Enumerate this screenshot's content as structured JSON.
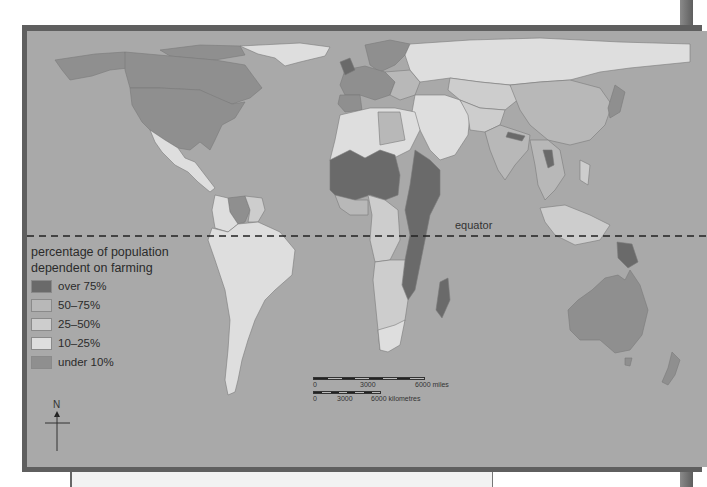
{
  "map": {
    "equator_label": "equator",
    "background_color": "#a9a9a9",
    "legend": {
      "title_line1": "percentage of population",
      "title_line2": "dependent on farming",
      "items": [
        {
          "label": "over 75%",
          "color": "#6a6a6a"
        },
        {
          "label": "50–75%",
          "color": "#b8b8b8"
        },
        {
          "label": "25–50%",
          "color": "#cdcdcd"
        },
        {
          "label": "10–25%",
          "color": "#dedede"
        },
        {
          "label": "under 10%",
          "color": "#8f8f8f"
        }
      ]
    },
    "scale": {
      "miles": {
        "labels": [
          "0",
          "3000",
          "6000 miles"
        ]
      },
      "kilometres": {
        "labels": [
          "0",
          "3000",
          "6000 kilometres"
        ]
      }
    },
    "north_arrow_label": "N"
  }
}
